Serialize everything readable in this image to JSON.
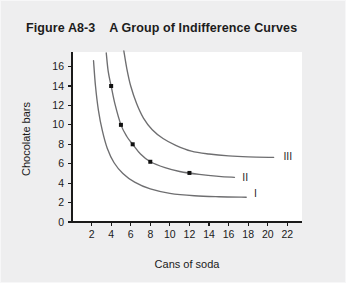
{
  "figure": {
    "label": "Figure A8-3",
    "title": "A Group of Indifference Curves",
    "title_full": "Figure A8-3    A Group of Indifference Curves",
    "background_color": "#eeeeef",
    "panel_color": "#ffffff"
  },
  "chart_data": {
    "type": "line",
    "title": "A Group of Indifference Curves",
    "xlabel": "Cans of soda",
    "ylabel": "Chocolate bars",
    "xlim": [
      0,
      23.5
    ],
    "ylim": [
      0,
      17.5
    ],
    "xticks": [
      2,
      4,
      6,
      8,
      10,
      12,
      14,
      16,
      18,
      20,
      22
    ],
    "yticks": [
      0,
      2,
      4,
      6,
      8,
      10,
      12,
      14,
      16
    ],
    "xtick_labels": [
      "2",
      "4",
      "6",
      "8",
      "10",
      "12",
      "14",
      "16",
      "18",
      "20",
      "22"
    ],
    "ytick_labels": [
      "0",
      "2",
      "4",
      "6",
      "8",
      "10",
      "12",
      "14",
      "16"
    ],
    "grid": false,
    "legend_position": "inline-end-of-curve",
    "line_color": "#6e6e70",
    "point_color": "#111111",
    "series": [
      {
        "name": "I",
        "label": "I",
        "label_x": 18.6,
        "label_y": 2.9,
        "points": [
          {
            "x": 2.2,
            "y": 16.6
          },
          {
            "x": 2.4,
            "y": 14.0
          },
          {
            "x": 2.7,
            "y": 11.5
          },
          {
            "x": 3.1,
            "y": 9.4
          },
          {
            "x": 3.6,
            "y": 7.6
          },
          {
            "x": 4.3,
            "y": 6.1
          },
          {
            "x": 5.2,
            "y": 5.0
          },
          {
            "x": 6.4,
            "y": 4.1
          },
          {
            "x": 8.0,
            "y": 3.4
          },
          {
            "x": 10.0,
            "y": 2.95
          },
          {
            "x": 12.5,
            "y": 2.7
          },
          {
            "x": 15.0,
            "y": 2.6
          },
          {
            "x": 17.8,
            "y": 2.55
          }
        ],
        "markers": []
      },
      {
        "name": "II",
        "label": "II",
        "label_x": 17.4,
        "label_y": 4.6,
        "points": [
          {
            "x": 3.5,
            "y": 17.4
          },
          {
            "x": 3.7,
            "y": 15.5
          },
          {
            "x": 4.0,
            "y": 14.0
          },
          {
            "x": 4.4,
            "y": 12.1
          },
          {
            "x": 5.0,
            "y": 10.0
          },
          {
            "x": 5.6,
            "y": 8.8
          },
          {
            "x": 6.2,
            "y": 8.0
          },
          {
            "x": 7.0,
            "y": 7.0
          },
          {
            "x": 8.0,
            "y": 6.2
          },
          {
            "x": 9.5,
            "y": 5.6
          },
          {
            "x": 11.0,
            "y": 5.2
          },
          {
            "x": 13.0,
            "y": 4.9
          },
          {
            "x": 15.0,
            "y": 4.7
          },
          {
            "x": 16.6,
            "y": 4.6
          }
        ],
        "markers": [
          {
            "x": 4.0,
            "y": 14.0
          },
          {
            "x": 5.0,
            "y": 10.0
          },
          {
            "x": 6.2,
            "y": 8.0
          },
          {
            "x": 8.0,
            "y": 6.2
          },
          {
            "x": 12.0,
            "y": 5.05
          }
        ]
      },
      {
        "name": "III",
        "label": "III",
        "label_x": 21.6,
        "label_y": 6.7,
        "points": [
          {
            "x": 5.3,
            "y": 17.6
          },
          {
            "x": 5.6,
            "y": 15.8
          },
          {
            "x": 6.0,
            "y": 14.0
          },
          {
            "x": 6.6,
            "y": 12.2
          },
          {
            "x": 7.3,
            "y": 10.7
          },
          {
            "x": 8.2,
            "y": 9.5
          },
          {
            "x": 9.3,
            "y": 8.6
          },
          {
            "x": 10.6,
            "y": 7.9
          },
          {
            "x": 12.2,
            "y": 7.3
          },
          {
            "x": 14.0,
            "y": 7.0
          },
          {
            "x": 16.0,
            "y": 6.8
          },
          {
            "x": 18.0,
            "y": 6.7
          },
          {
            "x": 20.6,
            "y": 6.65
          }
        ],
        "markers": []
      }
    ]
  }
}
